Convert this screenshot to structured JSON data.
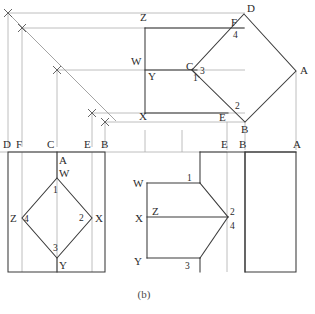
{
  "figure": {
    "caption": "(b)",
    "line_color": "#3a3a3a",
    "projection_color": "#a8a8a8",
    "miter_color": "#8d8d8d"
  },
  "views": {
    "top_right": {
      "name": "auxiliary-diamond-view",
      "vertex_labels": [
        {
          "text": "D",
          "x": 247,
          "y": 12
        },
        {
          "text": "A",
          "x": 300,
          "y": 74
        },
        {
          "text": "B",
          "x": 241,
          "y": 133
        },
        {
          "text": "C",
          "x": 186,
          "y": 70
        },
        {
          "text": "F",
          "x": 231,
          "y": 26
        },
        {
          "text": "E",
          "x": 219,
          "y": 121
        }
      ],
      "number_labels": [
        {
          "text": "1",
          "x": 193,
          "y": 81
        },
        {
          "text": "2",
          "x": 235,
          "y": 109
        },
        {
          "text": "3",
          "x": 200,
          "y": 74
        },
        {
          "text": "4",
          "x": 233,
          "y": 38
        }
      ],
      "ref_labels": [
        {
          "text": "Z",
          "x": 140,
          "y": 21
        },
        {
          "text": "W",
          "x": 134,
          "y": 65
        },
        {
          "text": "Y",
          "x": 149,
          "y": 79
        },
        {
          "text": "X",
          "x": 139,
          "y": 120
        }
      ]
    },
    "bottom_left": {
      "name": "front-diamond-view",
      "edge_labels": [
        {
          "text": "D",
          "x": 4,
          "y": 148
        },
        {
          "text": "F",
          "x": 18,
          "y": 148
        },
        {
          "text": "C",
          "x": 48,
          "y": 148
        },
        {
          "text": "E",
          "x": 84,
          "y": 148
        },
        {
          "text": "B",
          "x": 101,
          "y": 148
        },
        {
          "text": "A",
          "x": 60,
          "y": 163
        }
      ],
      "vertex_labels": [
        {
          "text": "W",
          "x": 60,
          "y": 177
        },
        {
          "text": "Z",
          "x": 11,
          "y": 222
        },
        {
          "text": "X",
          "x": 95,
          "y": 222
        },
        {
          "text": "Y",
          "x": 60,
          "y": 268
        }
      ],
      "number_labels": [
        {
          "text": "1",
          "x": 54,
          "y": 192
        },
        {
          "text": "4",
          "x": 24,
          "y": 222
        },
        {
          "text": "2",
          "x": 80,
          "y": 221
        },
        {
          "text": "3",
          "x": 54,
          "y": 251
        }
      ]
    },
    "bottom_right": {
      "name": "side-profile-view",
      "edge_labels": [
        {
          "text": "E",
          "x": 222,
          "y": 148
        },
        {
          "text": "B",
          "x": 240,
          "y": 148
        },
        {
          "text": "A",
          "x": 294,
          "y": 148
        }
      ],
      "vertex_labels": [
        {
          "text": "W",
          "x": 134,
          "y": 186
        },
        {
          "text": "Z",
          "x": 153,
          "y": 215
        },
        {
          "text": "X",
          "x": 136,
          "y": 221
        },
        {
          "text": "Y",
          "x": 135,
          "y": 265
        }
      ],
      "number_labels": [
        {
          "text": "1",
          "x": 188,
          "y": 180
        },
        {
          "text": "2",
          "x": 230,
          "y": 215
        },
        {
          "text": "4",
          "x": 230,
          "y": 228
        },
        {
          "text": "3",
          "x": 186,
          "y": 268
        }
      ]
    }
  }
}
